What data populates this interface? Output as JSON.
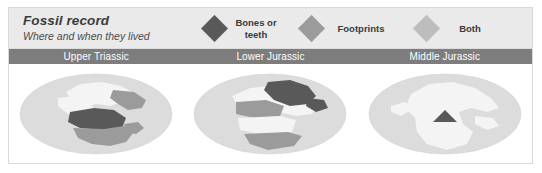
{
  "figure": {
    "title": "Fossil record",
    "subtitle": "Where and when they lived"
  },
  "legend": {
    "items": [
      {
        "label": "Bones or\nteeth",
        "icon": "diamond-icon",
        "color": "#595959"
      },
      {
        "label": "Footprints",
        "icon": "diamond-icon",
        "color": "#9b9b9b"
      },
      {
        "label": "Both",
        "icon": "diamond-icon",
        "color": "#bdbdbd"
      }
    ]
  },
  "periods": [
    {
      "name": "Upper Triassic"
    },
    {
      "name": "Lower Jurassic"
    },
    {
      "name": "Middle Jurassic"
    }
  ],
  "colors": {
    "panel_background": "#ffffff",
    "panel_border": "#d9d9d9",
    "header_background": "#eaeaea",
    "period_bar_background": "#7d7d7d",
    "period_label_text": "#ffffff",
    "ocean": "#dcdcdc",
    "land_light": "#f4f4f4",
    "fossil_bones": "#595959",
    "fossil_footprints": "#9b9b9b",
    "fossil_both": "#bdbdbd"
  },
  "maps": [
    {
      "period": "Upper Triassic",
      "caption": "Upper Triassic",
      "regions": [
        {
          "name": "north-america-north",
          "fill_key": "land_light"
        },
        {
          "name": "north-america-northeast",
          "fill_key": "fossil_footprints"
        },
        {
          "name": "north-america-west",
          "fill_key": "fossil_bones"
        },
        {
          "name": "north-america-south",
          "fill_key": "fossil_footprints"
        }
      ]
    },
    {
      "period": "Lower Jurassic",
      "caption": "Lower Jurassic",
      "regions": [
        {
          "name": "north-america-northeast",
          "fill_key": "fossil_bones"
        },
        {
          "name": "north-america-north",
          "fill_key": "fossil_footprints"
        },
        {
          "name": "north-america-central",
          "fill_key": "land_light"
        },
        {
          "name": "north-america-south",
          "fill_key": "fossil_footprints"
        }
      ]
    },
    {
      "period": "Middle Jurassic",
      "caption": "Middle Jurassic",
      "regions": [
        {
          "name": "north-america-whole",
          "fill_key": "land_light"
        },
        {
          "name": "north-america-marker",
          "fill_key": "fossil_bones"
        }
      ]
    }
  ]
}
